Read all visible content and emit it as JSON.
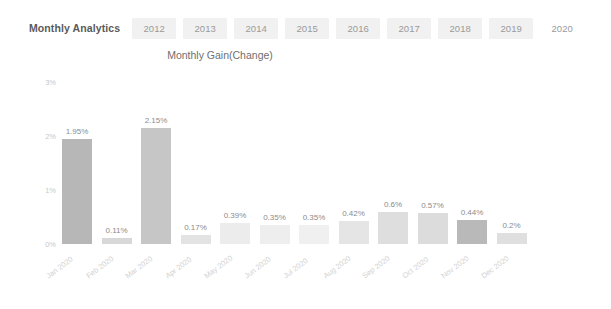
{
  "header": {
    "analytics_label": "Monthly Analytics",
    "tabs": [
      {
        "label": "2012",
        "active": false
      },
      {
        "label": "2013",
        "active": false
      },
      {
        "label": "2014",
        "active": false
      },
      {
        "label": "2015",
        "active": false
      },
      {
        "label": "2016",
        "active": false
      },
      {
        "label": "2017",
        "active": false
      },
      {
        "label": "2018",
        "active": false
      },
      {
        "label": "2019",
        "active": false
      },
      {
        "label": "2020",
        "active": true
      }
    ]
  },
  "chart_data": {
    "type": "bar",
    "title": "Monthly Gain(Change)",
    "xlabel": "",
    "ylabel": "",
    "ylim": [
      0,
      3
    ],
    "grid": false,
    "legend": null,
    "ytick_labels": [
      "0%",
      "1%",
      "2%",
      "3%"
    ],
    "ytick_values": [
      0,
      1,
      2,
      3
    ],
    "categories": [
      "Jan 2020",
      "Feb 2020",
      "Mar 2020",
      "Apr 2020",
      "May 2020",
      "Jun 2020",
      "Jul 2020",
      "Aug 2020",
      "Sep 2020",
      "Oct 2020",
      "Nov 2020",
      "Dec 2020"
    ],
    "values": [
      1.95,
      0.11,
      2.15,
      0.17,
      0.39,
      0.35,
      0.35,
      0.42,
      0.6,
      0.57,
      0.44,
      0.2
    ],
    "data_labels": [
      "1.95%",
      "0.11%",
      "2.15%",
      "0.17%",
      "0.39%",
      "0.35%",
      "0.35%",
      "0.42%",
      "0.6%",
      "0.57%",
      "0.44%",
      "0.2%"
    ],
    "bar_colors": [
      "#b7b7b7",
      "#d8d8d8",
      "#c6c6c6",
      "#e3e3e3",
      "#ececec",
      "#eeeeee",
      "#f0f0f0",
      "#e5e5e5",
      "#dedede",
      "#dcdcdc",
      "#b9b9b9",
      "#dfdfdf"
    ]
  },
  "colors": {
    "page_background": "#ffffff",
    "tab_background": "#f1f1f1",
    "tab_text": "#9a9a9a",
    "title_text": "#5a5a5a",
    "axis_text": "#c9c9c9",
    "value_text": "#8c8c8c",
    "category_text": "#d2d2d2"
  }
}
